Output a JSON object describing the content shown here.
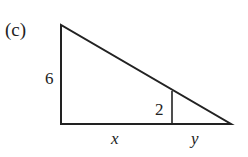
{
  "figure": {
    "label": "(c)",
    "side_left": "6",
    "inner_height": "2",
    "base_left": "x",
    "base_right": "y"
  },
  "colors": {
    "stroke": "#222222",
    "background": "#ffffff"
  }
}
